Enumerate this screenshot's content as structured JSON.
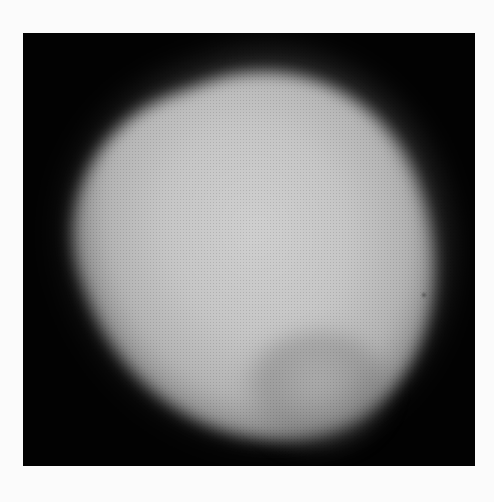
{
  "image": {
    "description": "Grayscale photograph of a bright, diffuse egg-shaped glowing blob on a black square background",
    "panel": {
      "background_color": "#020202",
      "page_background": "#fbfbfb"
    },
    "subject": {
      "core_color": "#cfcfcf",
      "edge_color": "#7a7a7a",
      "shape": "tilted egg / teardrop, tapering toward bottom-right"
    },
    "features": [
      {
        "name": "dark-speck",
        "approx_x": 422,
        "approx_y": 293
      }
    ]
  }
}
